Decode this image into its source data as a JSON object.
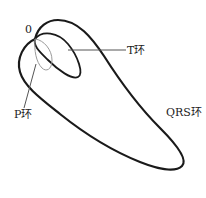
{
  "diagram": {
    "origin_label": "0",
    "labels": {
      "t_loop": "T环",
      "p_loop": "P环",
      "qrs_loop": "QRS环"
    },
    "colors": {
      "qrs_loop": "#1a1a1a",
      "t_loop": "#1a1a1a",
      "p_loop": "#9a9a9a",
      "leader_line": "#555555"
    }
  }
}
